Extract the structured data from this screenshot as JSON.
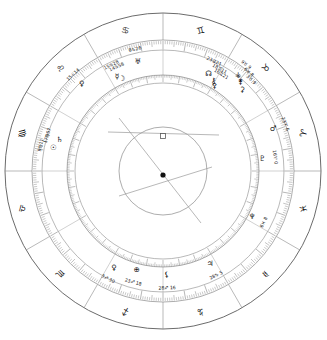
{
  "chart": {
    "type": "astrological-wheel",
    "center": {
      "x": 163,
      "y": 171
    },
    "radii": {
      "outer_rim": 158,
      "sign_band_inner": 131,
      "tick_ring_outer": 130,
      "tick_ring_inner": 121,
      "house_wheel_outer": 96,
      "house_tick_inner": 88,
      "inner_circle": 44
    },
    "colors": {
      "line": "#5a5a5a",
      "thin_line": "#8a8a8a",
      "tick": "#7a7a7a",
      "text": "#111111",
      "background": "#ffffff",
      "aspect_line": "#9a9a9a"
    },
    "center_marker": {
      "dot": {
        "x": 163,
        "y": 175,
        "r": 2.6
      },
      "square": {
        "x": 163,
        "y": 136,
        "size": 5,
        "name": "square-aspect-marker"
      }
    },
    "aspect_lines": [
      {
        "x1": 108,
        "y1": 132,
        "x2": 219,
        "y2": 135
      },
      {
        "x1": 119,
        "y1": 118,
        "x2": 201,
        "y2": 223
      },
      {
        "x1": 119,
        "y1": 196,
        "x2": 212,
        "y2": 167
      }
    ],
    "zodiac_signs": [
      {
        "name": "cancer",
        "glyph": "♋",
        "angle": 105,
        "label": "Cancer"
      },
      {
        "name": "gemini",
        "glyph": "♊",
        "angle": 75,
        "label": "Gemini"
      },
      {
        "name": "taurus",
        "glyph": "♉",
        "angle": 45,
        "label": "Taurus"
      },
      {
        "name": "aries",
        "glyph": "♈",
        "angle": 15,
        "label": "Aries"
      },
      {
        "name": "pisces",
        "glyph": "♓",
        "angle": 345,
        "label": "Pisces"
      },
      {
        "name": "aquarius",
        "glyph": "♒",
        "angle": 315,
        "label": "Aquarius"
      },
      {
        "name": "capricorn",
        "glyph": "♑",
        "angle": 285,
        "label": "Capricorn"
      },
      {
        "name": "sagittarius",
        "glyph": "♐",
        "angle": 255,
        "label": "Sagittarius"
      },
      {
        "name": "scorpio",
        "glyph": "♏",
        "angle": 225,
        "label": "Scorpio"
      },
      {
        "name": "libra",
        "glyph": "♎",
        "angle": 195,
        "label": "Libra"
      },
      {
        "name": "virgo",
        "glyph": "♍",
        "angle": 165,
        "label": "Virgo"
      },
      {
        "name": "leo",
        "glyph": "♌",
        "angle": 135,
        "label": "Leo"
      }
    ],
    "house_cusps_deg": [
      90,
      60,
      30,
      0,
      330,
      300,
      270,
      240,
      210,
      180,
      150,
      120
    ],
    "planets": [
      {
        "name": "sun",
        "glyph": "☉",
        "angle": 168,
        "radius": 112,
        "degree": "9♍11",
        "label": "Sun 9 Virgo 11"
      },
      {
        "name": "saturn",
        "glyph": "♄",
        "angle": 163,
        "radius": 108,
        "degree": "17♍57",
        "label": "Saturn 17 Virgo 57"
      },
      {
        "name": "venus",
        "glyph": "♀",
        "angle": 133,
        "radius": 119,
        "degree": "15♌14",
        "label": "Venus 15 Leo 14"
      },
      {
        "name": "mercury",
        "glyph": "☿",
        "angle": 116,
        "radius": 105,
        "degree": "15♋28",
        "label": "Mercury 15 Cancer 28"
      },
      {
        "name": "moon",
        "glyph": "☽",
        "angle": 114,
        "radius": 101,
        "degree": "14♋58",
        "label": "Moon 14 Cancer 58"
      },
      {
        "name": "uranus",
        "glyph": "♅",
        "angle": 103,
        "radius": 112,
        "degree": "6♋26",
        "label": "Uranus 6 Cancer 26"
      },
      {
        "name": "node",
        "glyph": "☊",
        "angle": 65,
        "radius": 108,
        "degree": "23♊21",
        "label": "North Node 23 Gemini 21"
      },
      {
        "name": "chiron",
        "glyph": "⚷",
        "angle": 61,
        "radius": 104,
        "degree": "18♊11",
        "label": "Chiron 18 Gemini 11"
      },
      {
        "name": "pallas",
        "glyph": "⚴",
        "angle": 59,
        "radius": 100,
        "degree": "16♊21",
        "label": "Pallas 16 Gemini 21"
      },
      {
        "name": "vesta",
        "glyph": "⚶",
        "angle": 52,
        "radius": 122,
        "degree": "9♉ 9",
        "label": "Vesta 9 Taurus 09"
      },
      {
        "name": "juno",
        "glyph": "⚵",
        "angle": 49,
        "radius": 118,
        "degree": "6♉ 8",
        "label": "Juno 6 Taurus 08"
      },
      {
        "name": "ceres",
        "glyph": "⚳",
        "angle": 46,
        "radius": 114,
        "degree": "3♉ 9",
        "label": "Ceres 3 Taurus 09"
      },
      {
        "name": "mars",
        "glyph": "♂",
        "angle": 21,
        "radius": 118,
        "degree": "23♈ 6",
        "label": "Mars 23 Aries 06"
      },
      {
        "name": "pluto",
        "glyph": "♇",
        "angle": 7,
        "radius": 100,
        "degree": "16♈ 0",
        "label": "Pluto 16 Aries 00"
      },
      {
        "name": "neptune",
        "glyph": "♆",
        "angle": 333,
        "radius": 100,
        "degree": "6♓ 8",
        "label": "Neptune 6 Pisces 08"
      },
      {
        "name": "jupiter",
        "glyph": "♃",
        "angle": 297,
        "radius": 104,
        "degree": "28♑ 5",
        "label": "Jupiter 28 Capricorn 05"
      },
      {
        "name": "lilith",
        "glyph": "⚸",
        "angle": 272,
        "radius": 104,
        "degree": "28♐ 16",
        "label": "Lilith 28 Sagittarius 16"
      },
      {
        "name": "fortune",
        "glyph": "⊕",
        "angle": 255,
        "radius": 102,
        "degree": "23♐ 18",
        "label": "Part of Fortune 23 Sagittarius 18"
      },
      {
        "name": "eris",
        "glyph": "♀",
        "angle": 243,
        "radius": 108,
        "degree": "3♐ 30",
        "label": "Eris 3 Sagittarius 30"
      }
    ]
  }
}
